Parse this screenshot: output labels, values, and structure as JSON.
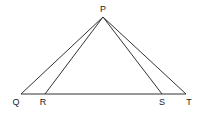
{
  "diagram": {
    "points": {
      "P": {
        "label": "P",
        "x": 103,
        "y": 17,
        "lx": 103,
        "ly": 12
      },
      "Q": {
        "label": "Q",
        "x": 21,
        "y": 94,
        "lx": 16,
        "ly": 105
      },
      "R": {
        "label": "R",
        "x": 45,
        "y": 94,
        "lx": 43,
        "ly": 105
      },
      "S": {
        "label": "S",
        "x": 162,
        "y": 94,
        "lx": 162,
        "ly": 105
      },
      "T": {
        "label": "T",
        "x": 186,
        "y": 94,
        "lx": 189,
        "ly": 105
      }
    },
    "segments": [
      [
        "P",
        "Q"
      ],
      [
        "P",
        "R"
      ],
      [
        "P",
        "S"
      ],
      [
        "P",
        "T"
      ],
      [
        "Q",
        "T"
      ]
    ],
    "line_color": "#333333"
  }
}
